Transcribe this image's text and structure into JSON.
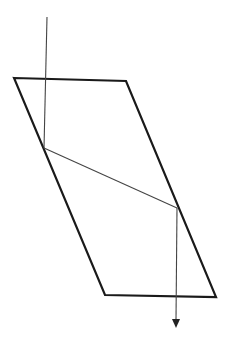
{
  "diagram": {
    "colors": {
      "block": "#1a1a1a",
      "ray": "#444444",
      "background": "#ffffff"
    },
    "labels": {
      "left_label": "",
      "right_label": "",
      "center_mark": ""
    },
    "elements": [
      {
        "name": "glass-block",
        "type": "parallelogram"
      },
      {
        "name": "incident-ray",
        "type": "line"
      },
      {
        "name": "refracted-ray",
        "type": "line"
      },
      {
        "name": "emergent-ray",
        "type": "arrow"
      }
    ]
  }
}
